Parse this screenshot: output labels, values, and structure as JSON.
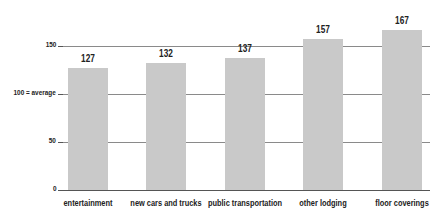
{
  "chart_data": {
    "type": "bar",
    "title": "",
    "xlabel": "",
    "ylabel": "",
    "categories": [
      "entertainment",
      "new cars and trucks",
      "public transportation",
      "other lodging",
      "floor coverings"
    ],
    "values": [
      127,
      132,
      137,
      157,
      167
    ],
    "value_labels": [
      "127",
      "132",
      "137",
      "157",
      "167"
    ],
    "yticks": [
      0,
      50,
      100,
      150
    ],
    "ytick_labels": [
      "0",
      "50",
      "100 = average",
      "150"
    ],
    "ylim": [
      0,
      175
    ],
    "grid": true,
    "legend": null,
    "colors": {
      "bar": "#c9c9c9",
      "grid": "#8a8a8a",
      "text": "#222222"
    }
  }
}
